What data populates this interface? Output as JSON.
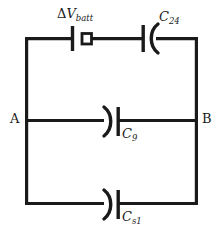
{
  "figure": {
    "kind": "circuit-diagram",
    "background_color": "#ffffff",
    "wire_color": "#1a1a1a",
    "wire_width": 3.2
  },
  "nodes": [
    {
      "id": "A",
      "label": "A",
      "x": 25,
      "y": 120
    },
    {
      "id": "B",
      "label": "B",
      "x": 198,
      "y": 120
    }
  ],
  "components": [
    {
      "id": "battery",
      "type": "battery",
      "label_delta": "Δ",
      "label_symbol": "V",
      "label_subscript": "batt",
      "label_full": "ΔV_batt",
      "branch": "top",
      "x": 78,
      "y": 37
    },
    {
      "id": "c24",
      "type": "capacitor-curved",
      "label_symbol": "C",
      "label_subscript": "24",
      "label_full": "C_24",
      "branch": "top",
      "orientation": "curve-right",
      "x": 148,
      "y": 37
    },
    {
      "id": "c9",
      "type": "capacitor-curved",
      "label_symbol": "C",
      "label_subscript": "9",
      "label_full": "C_9",
      "branch": "middle",
      "orientation": "curve-left",
      "x": 112,
      "y": 120
    },
    {
      "id": "cs1",
      "type": "capacitor-curved",
      "label_symbol": "C",
      "label_subscript": "s1",
      "label_full": "C_s1",
      "branch": "bottom",
      "orientation": "curve-left",
      "x": 112,
      "y": 203
    }
  ],
  "frame": {
    "left_x": 25,
    "right_x": 198,
    "top_y": 37,
    "middle_y": 120,
    "bottom_y": 203
  }
}
